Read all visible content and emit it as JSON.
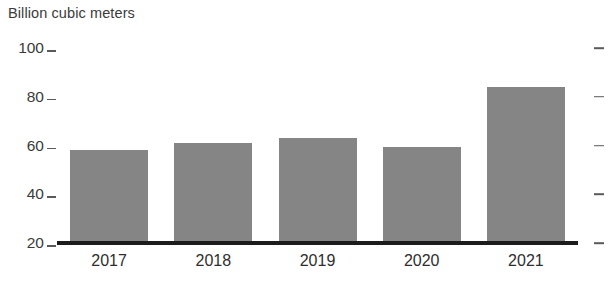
{
  "chart_data": {
    "type": "bar",
    "title": "Billion cubic meters",
    "xlabel": "",
    "ylabel": "Billion cubic meters",
    "categories": [
      "2017",
      "2018",
      "2019",
      "2020",
      "2021"
    ],
    "values": [
      58,
      61,
      63,
      59.5,
      84
    ],
    "ylim": [
      20,
      100
    ],
    "yticks": [
      20,
      40,
      60,
      80,
      100
    ],
    "ytick_labels": [
      "20",
      "40",
      "60",
      "80",
      "100"
    ],
    "grid": false,
    "legend": null,
    "series": [
      {
        "name": "Billion cubic meters",
        "values": [
          58,
          61,
          63,
          59.5,
          84
        ]
      }
    ],
    "colors": {
      "bar": "#858585",
      "axis": "#1c1c1c",
      "tick": "#5a5a5a",
      "text": "#3b3b3b",
      "background": "#ffffff"
    }
  }
}
